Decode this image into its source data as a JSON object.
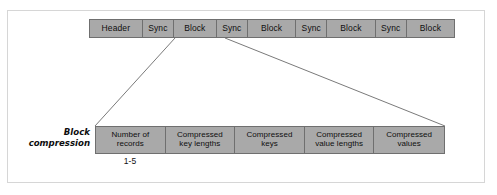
{
  "figure": {
    "colors": {
      "box_fill": "#a9a9a9",
      "box_border": "#6f6f6f",
      "connector_line": "#7a7a7a",
      "frame_border": "#d6d6d6",
      "text": "#0f0f0f",
      "background": "#ffffff"
    }
  },
  "stream_row": {
    "name": "sequence-file-stream",
    "cells": [
      {
        "label": "Header",
        "width": 57
      },
      {
        "label": "Sync",
        "width": 34
      },
      {
        "label": "Block",
        "width": 46
      },
      {
        "label": "Sync",
        "width": 34
      },
      {
        "label": "Block",
        "width": 52
      },
      {
        "label": "Sync",
        "width": 34
      },
      {
        "label": "Block",
        "width": 52
      },
      {
        "label": "Sync",
        "width": 34
      },
      {
        "label": "Block",
        "width": 51
      }
    ]
  },
  "block_compression": {
    "label_line1": "Block",
    "label_line2": "compression",
    "range_annotation": "1-5",
    "cells": [
      {
        "line1": "Number of",
        "line2": "records",
        "width": 70
      },
      {
        "line1": "Compressed",
        "line2": "key lengths",
        "width": 70
      },
      {
        "line1": "Compressed",
        "line2": "keys",
        "width": 70
      },
      {
        "line1": "Compressed",
        "line2": "value lengths",
        "width": 70
      },
      {
        "line1": "Compressed",
        "line2": "values",
        "width": 70
      }
    ]
  },
  "connectors": {
    "left": {
      "x1": 175,
      "y1": 38,
      "x2": 95,
      "y2": 126
    },
    "right": {
      "x1": 225,
      "y1": 38,
      "x2": 445,
      "y2": 126
    }
  }
}
